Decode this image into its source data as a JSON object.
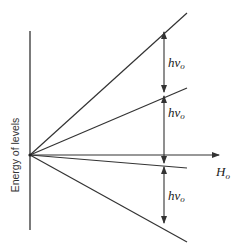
{
  "diagram": {
    "y_axis_label": "Energy of levels",
    "x_axis_label": {
      "main": "H",
      "sub": "o"
    },
    "spacing_labels": [
      {
        "main": "hν",
        "sub": "o"
      },
      {
        "main": "hν",
        "sub": "o"
      },
      {
        "main": "hν",
        "sub": "o"
      }
    ],
    "levels": [
      {
        "name": "level-1",
        "end_y": 13
      },
      {
        "name": "level-2",
        "end_y": 88
      },
      {
        "name": "level-3",
        "end_y": 168
      },
      {
        "name": "level-4",
        "end_y": 242
      }
    ],
    "colors": {
      "line": "#333333",
      "background": "#ffffff"
    }
  }
}
